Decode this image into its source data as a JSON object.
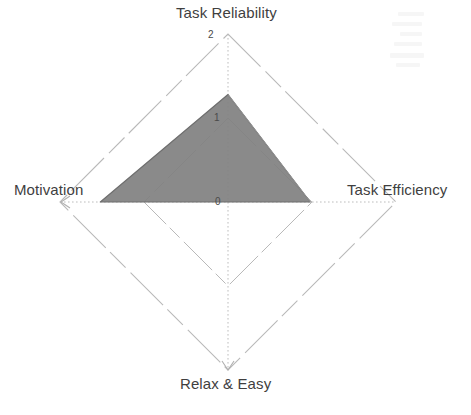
{
  "chart_data": {
    "type": "radar",
    "title": "",
    "subtitle": "",
    "xlabel": "",
    "ylabel": "",
    "categories": [
      "Task Reliability",
      "Task Efficiency",
      "Relax & Easy",
      "Motivation"
    ],
    "values": [
      1.28,
      0.98,
      0.0,
      1.52
    ],
    "series": [
      {
        "name": "",
        "values": [
          1.28,
          0.98,
          0.0,
          1.52
        ],
        "fill_color": "#808080",
        "line_color": "#6e6e6e"
      }
    ],
    "tick_labels": [
      "0",
      "1",
      "2"
    ],
    "tick_values": [
      0,
      1,
      2
    ],
    "rlim": [
      0,
      2
    ],
    "grid": true,
    "grid_color": "#b5b5b5",
    "legend": "none",
    "axis_start_angle_deg": 90,
    "axis_direction": "clockwise"
  },
  "axes": {
    "top": {
      "label": "Task Reliability",
      "value": 1.28
    },
    "right": {
      "label": "Task Efficiency",
      "value": 0.98
    },
    "bottom": {
      "label": "Relax & Easy",
      "value": 0.0
    },
    "left": {
      "label": "Motivation",
      "value": 1.52
    }
  },
  "ticks": {
    "outer": "2",
    "middle": "1",
    "center": "0"
  },
  "colors": {
    "background": "#ffffff",
    "fill": "#808080",
    "stroke": "#6e6e6e",
    "grid": "#b5b5b5",
    "text": "#3f3f3f",
    "tick_text": "#4a4a4a"
  }
}
